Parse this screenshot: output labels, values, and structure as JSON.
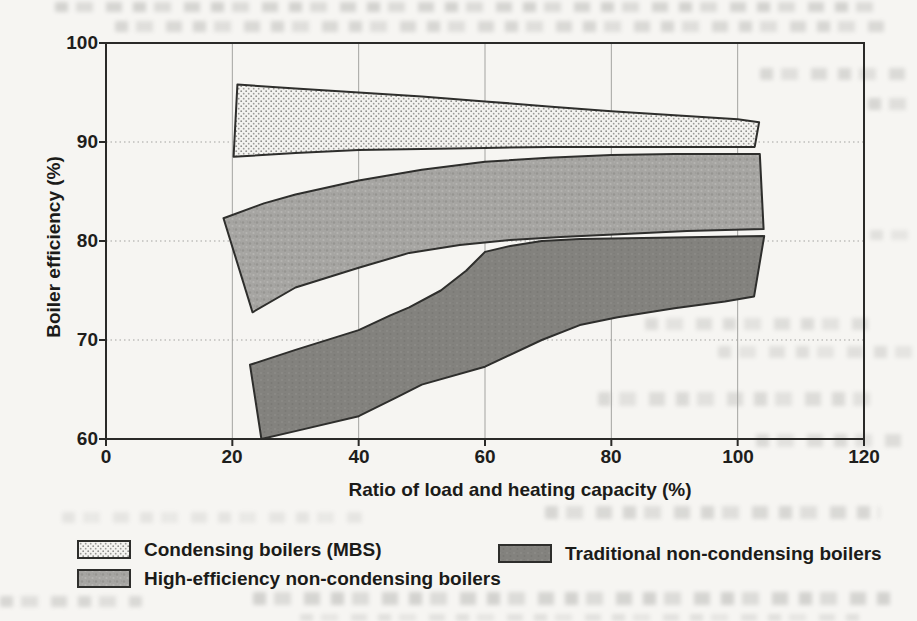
{
  "chart_data": {
    "type": "area",
    "title": "",
    "xlabel": "Ratio of load and heating capacity (%)",
    "ylabel": "Boiler efficiency (%)",
    "xlim": [
      0,
      120
    ],
    "ylim": [
      60,
      100
    ],
    "xticks": [
      0,
      20,
      40,
      60,
      80,
      100,
      120
    ],
    "yticks": [
      60,
      70,
      80,
      90,
      100
    ],
    "grid": true,
    "gridlines_vertical_at": [
      20,
      40,
      60,
      80,
      100
    ],
    "gridlines_horizontal_at": [
      70,
      80,
      90
    ],
    "legend_position": "below-chart",
    "series": [
      {
        "name": "Condensing boilers (MBS)",
        "style": "light-dotted",
        "band_x": [
          20.5,
          30,
          40,
          50,
          60,
          70,
          80,
          90,
          100,
          103.4
        ],
        "band_upper": [
          95.8,
          95.4,
          95.0,
          94.6,
          94.1,
          93.6,
          93.1,
          92.7,
          92.3,
          92.0
        ],
        "band_lower": [
          88.5,
          88.9,
          89.2,
          89.3,
          89.4,
          89.5,
          89.5,
          89.5,
          89.5,
          89.5
        ],
        "outline": [
          [
            20.8,
            95.8
          ],
          [
            30,
            95.4
          ],
          [
            40,
            95.0
          ],
          [
            50,
            94.6
          ],
          [
            60,
            94.1
          ],
          [
            70,
            93.6
          ],
          [
            80,
            93.1
          ],
          [
            90,
            92.7
          ],
          [
            100,
            92.3
          ],
          [
            103.4,
            92.0
          ],
          [
            102.7,
            89.5
          ],
          [
            90,
            89.5
          ],
          [
            80,
            89.5
          ],
          [
            70,
            89.5
          ],
          [
            60,
            89.4
          ],
          [
            50,
            89.3
          ],
          [
            40,
            89.2
          ],
          [
            30,
            88.9
          ],
          [
            20.2,
            88.5
          ]
        ]
      },
      {
        "name": "High-efficiency non-condensing boilers",
        "style": "medium-textured",
        "band_x": [
          19,
          30,
          40,
          50,
          60,
          70,
          80,
          90,
          103.8
        ],
        "band_upper": [
          82.3,
          84.7,
          86.1,
          87.2,
          88.0,
          88.4,
          88.7,
          88.8,
          88.8
        ],
        "band_lower": [
          72.8,
          75.3,
          77.3,
          79.0,
          79.8,
          80.3,
          80.7,
          81.0,
          81.2
        ],
        "outline": [
          [
            18.6,
            82.3
          ],
          [
            25,
            83.8
          ],
          [
            30,
            84.7
          ],
          [
            40,
            86.1
          ],
          [
            50,
            87.2
          ],
          [
            60,
            88.0
          ],
          [
            70,
            88.4
          ],
          [
            80,
            88.7
          ],
          [
            90,
            88.8
          ],
          [
            103.5,
            88.8
          ],
          [
            104.1,
            81.2
          ],
          [
            92,
            81.0
          ],
          [
            82,
            80.7
          ],
          [
            72,
            80.4
          ],
          [
            64,
            80.1
          ],
          [
            56,
            79.6
          ],
          [
            48,
            78.8
          ],
          [
            40,
            77.3
          ],
          [
            30,
            75.3
          ],
          [
            23.2,
            72.8
          ]
        ]
      },
      {
        "name": "Traditional non-condensing boilers",
        "style": "dark-gray",
        "band_x": [
          23,
          30,
          40,
          50,
          60,
          70,
          80,
          90,
          104
        ],
        "band_upper": [
          67.5,
          69.0,
          71.0,
          74.0,
          78.9,
          80.0,
          80.3,
          80.4,
          80.5
        ],
        "band_lower": [
          60.0,
          60.8,
          62.3,
          65.5,
          67.3,
          70.2,
          72.2,
          73.2,
          74.4
        ],
        "outline": [
          [
            22.8,
            67.5
          ],
          [
            30,
            69.0
          ],
          [
            40,
            71.0
          ],
          [
            45,
            72.5
          ],
          [
            48,
            73.3
          ],
          [
            53,
            75.0
          ],
          [
            57,
            77.0
          ],
          [
            60,
            78.9
          ],
          [
            64,
            79.5
          ],
          [
            69,
            80.0
          ],
          [
            75,
            80.2
          ],
          [
            85,
            80.3
          ],
          [
            104.2,
            80.5
          ],
          [
            102.6,
            74.4
          ],
          [
            98,
            73.9
          ],
          [
            90,
            73.2
          ],
          [
            81,
            72.3
          ],
          [
            75,
            71.5
          ],
          [
            69,
            70.0
          ],
          [
            60,
            67.3
          ],
          [
            50,
            65.5
          ],
          [
            46,
            64.2
          ],
          [
            40,
            62.3
          ],
          [
            30,
            60.8
          ],
          [
            24.6,
            60.0
          ]
        ]
      }
    ]
  },
  "legend": {
    "items": [
      {
        "label": "Condensing boilers (MBS)",
        "swatch": "light-dotted"
      },
      {
        "label": "High-efficiency non-condensing boilers",
        "swatch": "medium-textured"
      },
      {
        "label": "Traditional non-condensing boilers",
        "swatch": "dark-gray"
      }
    ]
  },
  "colors": {
    "paper": "#f6f5f2",
    "band_outline": "#2e2e2c",
    "band_light": "#e7e6e3",
    "band_medium": "#a6a5a2",
    "band_dark": "#83827e",
    "gridline": "#a3a3a0",
    "axis": "#2a2a28",
    "text": "#1b1b19"
  }
}
